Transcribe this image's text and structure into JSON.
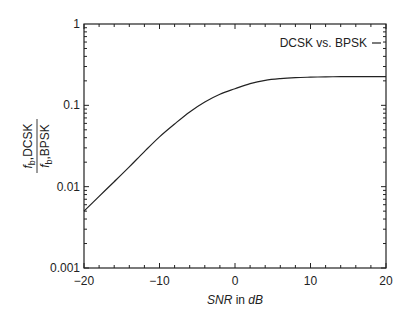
{
  "chart_data": {
    "type": "line",
    "title": "",
    "xlabel": "SNR in dB",
    "xlabel_parts": {
      "italic_a": "SNR",
      "normal": " in ",
      "italic_b": "dB"
    },
    "ylabel": "f_b,DCSK / f_b,BPSK",
    "ylabel_parts": {
      "num_sym": "f",
      "num_sub": "b",
      "num_text": ",DCSK",
      "den_sym": "f",
      "den_sub": "b",
      "den_text": ",BPSK"
    },
    "xlim": [
      -20,
      20
    ],
    "ylim": [
      0.001,
      1
    ],
    "yscale": "log",
    "grid": false,
    "legend_position": "upper right",
    "x_ticks": [
      -20,
      -10,
      0,
      10,
      20
    ],
    "x_tick_labels": [
      "−20",
      "−10",
      "0",
      "10",
      "20"
    ],
    "y_ticks": [
      0.001,
      0.01,
      0.1,
      1
    ],
    "y_tick_labels": [
      "0.001",
      "0.01",
      "0.1",
      "1"
    ],
    "series": [
      {
        "name": "DCSK vs. BPSK",
        "x": [
          -20,
          -18,
          -16,
          -14,
          -12,
          -10,
          -8,
          -6,
          -4,
          -2,
          0,
          2,
          4,
          6,
          8,
          10,
          12,
          14,
          16,
          18,
          20
        ],
        "values": [
          0.005,
          0.0076,
          0.0115,
          0.0175,
          0.027,
          0.041,
          0.059,
          0.083,
          0.11,
          0.137,
          0.16,
          0.185,
          0.203,
          0.213,
          0.219,
          0.222,
          0.224,
          0.225,
          0.225,
          0.225,
          0.225
        ]
      }
    ]
  },
  "legend": {
    "label": "DCSK vs. BPSK"
  }
}
